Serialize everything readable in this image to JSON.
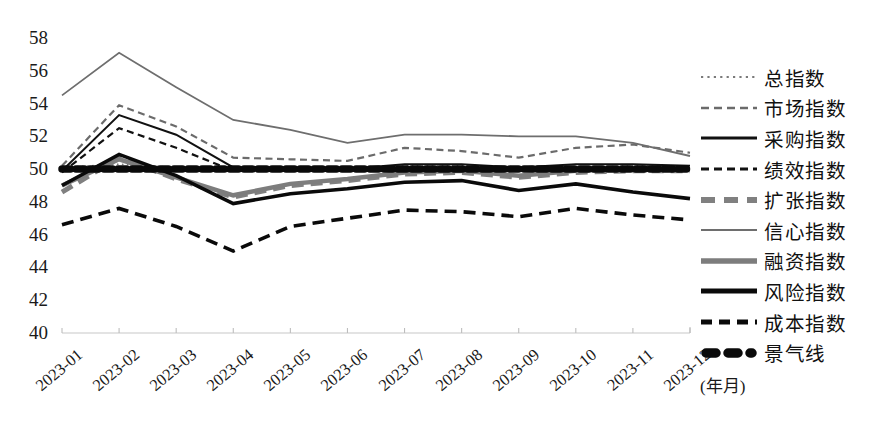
{
  "chart_data": {
    "type": "line",
    "title": "",
    "xlabel": "(年月)",
    "ylabel": "",
    "ylim": [
      40,
      58
    ],
    "yticks": [
      40,
      42,
      44,
      46,
      48,
      50,
      52,
      54,
      56,
      58
    ],
    "grid": false,
    "legend_position": "right",
    "categories": [
      "2023-01",
      "2023-02",
      "2023-03",
      "2023-04",
      "2023-05",
      "2023-06",
      "2023-07",
      "2023-08",
      "2023-09",
      "2023-10",
      "2023-11",
      "2023-12"
    ],
    "series": [
      {
        "name": "总指数",
        "style": "dotted",
        "color": "#7a7a7a",
        "width": 1.6,
        "values": [
          50.1,
          50.3,
          50.1,
          50.0,
          50.0,
          50.0,
          50.2,
          50.2,
          50.1,
          50.1,
          50.2,
          50.2
        ]
      },
      {
        "name": "市场指数",
        "style": "dashed",
        "color": "#6b6b6b",
        "width": 2.2,
        "values": [
          50.2,
          53.9,
          52.6,
          50.7,
          50.6,
          50.5,
          51.3,
          51.1,
          50.7,
          51.3,
          51.5,
          51.0
        ]
      },
      {
        "name": "采购指数",
        "style": "solid",
        "color": "#111111",
        "width": 2.0,
        "values": [
          49.9,
          53.3,
          52.1,
          50.1,
          50.1,
          50.0,
          50.3,
          50.3,
          50.1,
          50.3,
          50.3,
          50.2
        ]
      },
      {
        "name": "绩效指数",
        "style": "dashed",
        "color": "#111111",
        "width": 2.2,
        "values": [
          49.8,
          52.5,
          51.3,
          49.9,
          49.9,
          49.9,
          50.1,
          50.1,
          49.9,
          50.0,
          50.1,
          50.0
        ]
      },
      {
        "name": "扩张指数",
        "style": "dashed-thick",
        "color": "#808080",
        "width": 5.0,
        "values": [
          48.6,
          50.7,
          49.4,
          48.3,
          49.0,
          49.3,
          49.7,
          49.8,
          49.5,
          49.8,
          49.9,
          49.9
        ]
      },
      {
        "name": "信心指数",
        "style": "solid",
        "color": "#6e6e6e",
        "width": 1.8,
        "values": [
          54.5,
          57.1,
          55.0,
          53.0,
          52.4,
          51.6,
          52.1,
          52.1,
          52.0,
          52.0,
          51.6,
          50.8
        ]
      },
      {
        "name": "融资指数",
        "style": "solid-thick",
        "color": "#7d7d7d",
        "width": 4.5,
        "values": [
          49.0,
          50.6,
          49.5,
          48.4,
          49.1,
          49.4,
          49.8,
          49.9,
          49.6,
          49.9,
          50.0,
          50.0
        ]
      },
      {
        "name": "风险指数",
        "style": "solid",
        "color": "#0a0a0a",
        "width": 3.6,
        "values": [
          49.0,
          50.9,
          49.6,
          47.9,
          48.5,
          48.8,
          49.2,
          49.3,
          48.7,
          49.1,
          48.6,
          48.2
        ]
      },
      {
        "name": "成本指数",
        "style": "dashed-thick",
        "color": "#0a0a0a",
        "width": 3.6,
        "values": [
          46.6,
          47.6,
          46.5,
          45.0,
          46.5,
          47.0,
          47.5,
          47.4,
          47.1,
          47.6,
          47.2,
          46.9
        ]
      },
      {
        "name": "景气线",
        "style": "dotted-thick",
        "color": "#0a0a0a",
        "width": 7.5,
        "values": [
          50,
          50,
          50,
          50,
          50,
          50,
          50,
          50,
          50,
          50,
          50,
          50
        ]
      }
    ]
  },
  "axis": {
    "y_tick_labels": [
      "58",
      "56",
      "54",
      "52",
      "50",
      "48",
      "46",
      "44",
      "42",
      "40"
    ],
    "x_tick_labels": [
      "2023-01",
      "2023-02",
      "2023-03",
      "2023-04",
      "2023-05",
      "2023-06",
      "2023-07",
      "2023-08",
      "2023-09",
      "2023-10",
      "2023-11",
      "2023-12"
    ],
    "x_axis_title": "(年月)"
  },
  "legend": {
    "items": [
      {
        "label": "总指数",
        "key": "dotted-thin-gray"
      },
      {
        "label": "市场指数",
        "key": "dashed-gray"
      },
      {
        "label": "采购指数",
        "key": "solid-black"
      },
      {
        "label": "绩效指数",
        "key": "dashed-black"
      },
      {
        "label": "扩张指数",
        "key": "dashed-thick-gray"
      },
      {
        "label": "信心指数",
        "key": "solid-thin-gray"
      },
      {
        "label": "融资指数",
        "key": "solid-thick-gray"
      },
      {
        "label": "风险指数",
        "key": "solid-thick-black"
      },
      {
        "label": "成本指数",
        "key": "dashed-thick-black"
      },
      {
        "label": "景气线",
        "key": "dotted-thick-black"
      }
    ]
  }
}
